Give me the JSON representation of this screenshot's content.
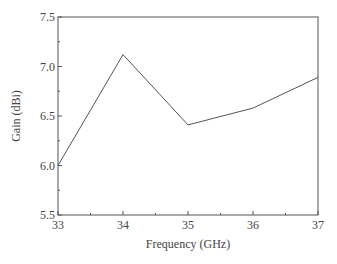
{
  "chart_data": {
    "type": "line",
    "title": "",
    "xlabel": "Frequency (GHz)",
    "ylabel": "Gain (dBi)",
    "x": [
      33,
      34,
      35,
      36,
      37
    ],
    "series": [
      {
        "name": "Gain",
        "values": [
          6.0,
          7.12,
          6.41,
          6.58,
          6.89
        ]
      }
    ],
    "xlim": [
      33,
      37
    ],
    "ylim": [
      5.5,
      7.5
    ],
    "xticks": [
      "33",
      "34",
      "35",
      "36",
      "37"
    ],
    "yticks": [
      "5.5",
      "6.0",
      "6.5",
      "7.0",
      "7.5"
    ],
    "grid": false,
    "legend": null
  },
  "style": {
    "line_color": "#555555",
    "axis_color": "#555555"
  }
}
